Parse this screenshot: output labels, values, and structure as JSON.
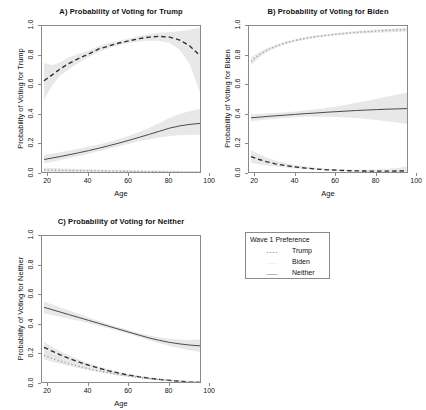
{
  "figure": {
    "axis_x_label": "Age",
    "x_ticks": [
      "20",
      "40",
      "60",
      "80",
      "100"
    ],
    "y_ticks": [
      "0.0",
      "0.2",
      "0.4",
      "0.6",
      "0.8",
      "1.0"
    ]
  },
  "panelA": {
    "title": "A) Probability of Voting for Trump",
    "ylabel": "Probability of Voting for Trump",
    "xlabel": "Age"
  },
  "panelB": {
    "title": "B) Probability of Voting for Biden",
    "ylabel": "Probability of Voting for Biden",
    "xlabel": "Age"
  },
  "panelC": {
    "title": "C) Probability of Voting for Neither",
    "ylabel": "Probability of Voting for Neither",
    "xlabel": "Age"
  },
  "legend": {
    "title": "Wave 1 Preference",
    "items": [
      {
        "label": "Trump",
        "style": "dashed"
      },
      {
        "label": "Biden",
        "style": "dotted"
      },
      {
        "label": "Neither",
        "style": "solid"
      }
    ]
  },
  "chart_data": [
    {
      "type": "line",
      "title": "A) Probability of Voting for Trump",
      "xlabel": "Age",
      "ylabel": "Probability of Voting for Trump",
      "xlim": [
        17,
        96
      ],
      "ylim": [
        0.0,
        1.0
      ],
      "xticks": [
        20,
        40,
        60,
        80,
        100
      ],
      "yticks": [
        0.0,
        0.2,
        0.4,
        0.6,
        0.8,
        1.0
      ],
      "grid": false,
      "legend_position": "external-right-bottom",
      "x": [
        18,
        22,
        26,
        30,
        35,
        40,
        45,
        50,
        55,
        60,
        65,
        70,
        75,
        80,
        85,
        90,
        95
      ],
      "series": [
        {
          "name": "Trump",
          "style": "dashed",
          "values": [
            0.63,
            0.67,
            0.71,
            0.745,
            0.78,
            0.81,
            0.845,
            0.865,
            0.885,
            0.9,
            0.915,
            0.925,
            0.93,
            0.925,
            0.905,
            0.865,
            0.8
          ],
          "ci_low": [
            0.5,
            0.6,
            0.665,
            0.705,
            0.75,
            0.79,
            0.825,
            0.85,
            0.87,
            0.885,
            0.895,
            0.9,
            0.9,
            0.885,
            0.84,
            0.74,
            0.55
          ],
          "ci_high": [
            0.75,
            0.735,
            0.755,
            0.785,
            0.81,
            0.835,
            0.865,
            0.885,
            0.9,
            0.915,
            0.93,
            0.945,
            0.955,
            0.96,
            0.965,
            0.975,
            0.99
          ]
        },
        {
          "name": "Biden",
          "style": "dotted",
          "values": [
            0.027,
            0.026,
            0.025,
            0.024,
            0.023,
            0.022,
            0.021,
            0.02,
            0.019,
            0.018,
            0.017,
            0.016,
            0.015,
            0.014,
            0.013,
            0.012,
            0.011
          ],
          "ci_low": [
            0.014,
            0.014,
            0.014,
            0.013,
            0.013,
            0.012,
            0.012,
            0.011,
            0.01,
            0.009,
            0.008,
            0.007,
            0.006,
            0.005,
            0.004,
            0.003,
            0.002
          ],
          "ci_high": [
            0.042,
            0.04,
            0.038,
            0.036,
            0.034,
            0.032,
            0.03,
            0.029,
            0.028,
            0.027,
            0.026,
            0.025,
            0.024,
            0.023,
            0.022,
            0.021,
            0.02
          ]
        },
        {
          "name": "Neither",
          "style": "solid",
          "values": [
            0.098,
            0.108,
            0.118,
            0.129,
            0.143,
            0.158,
            0.174,
            0.191,
            0.209,
            0.228,
            0.248,
            0.268,
            0.289,
            0.31,
            0.325,
            0.335,
            0.342
          ],
          "ci_low": [
            0.072,
            0.083,
            0.094,
            0.106,
            0.121,
            0.137,
            0.154,
            0.171,
            0.188,
            0.205,
            0.221,
            0.235,
            0.247,
            0.256,
            0.262,
            0.265,
            0.266
          ],
          "ci_high": [
            0.128,
            0.137,
            0.147,
            0.157,
            0.171,
            0.185,
            0.2,
            0.216,
            0.236,
            0.258,
            0.284,
            0.312,
            0.344,
            0.378,
            0.405,
            0.425,
            0.44
          ]
        }
      ]
    },
    {
      "type": "line",
      "title": "B) Probability of Voting for Biden",
      "xlabel": "Age",
      "ylabel": "Probability of Voting for Biden",
      "xlim": [
        17,
        96
      ],
      "ylim": [
        0.0,
        1.0
      ],
      "xticks": [
        20,
        40,
        60,
        80,
        100
      ],
      "yticks": [
        0.0,
        0.2,
        0.4,
        0.6,
        0.8,
        1.0
      ],
      "grid": false,
      "legend_position": "external-right-bottom",
      "x": [
        18,
        22,
        26,
        30,
        35,
        40,
        45,
        50,
        55,
        60,
        65,
        70,
        75,
        80,
        85,
        90,
        95
      ],
      "series": [
        {
          "name": "Trump",
          "style": "dashed",
          "values": [
            0.118,
            0.098,
            0.082,
            0.069,
            0.057,
            0.047,
            0.04,
            0.034,
            0.029,
            0.026,
            0.023,
            0.021,
            0.02,
            0.019,
            0.019,
            0.02,
            0.022
          ],
          "ci_low": [
            0.075,
            0.066,
            0.058,
            0.051,
            0.044,
            0.038,
            0.033,
            0.029,
            0.025,
            0.022,
            0.019,
            0.016,
            0.014,
            0.012,
            0.01,
            0.008,
            0.006
          ],
          "ci_high": [
            0.163,
            0.133,
            0.11,
            0.092,
            0.074,
            0.06,
            0.05,
            0.042,
            0.036,
            0.032,
            0.029,
            0.028,
            0.028,
            0.03,
            0.034,
            0.041,
            0.052
          ]
        },
        {
          "name": "Biden",
          "style": "dotted",
          "values": [
            0.762,
            0.805,
            0.838,
            0.862,
            0.886,
            0.903,
            0.917,
            0.928,
            0.937,
            0.945,
            0.951,
            0.957,
            0.962,
            0.966,
            0.97,
            0.973,
            0.976
          ],
          "ci_low": [
            0.735,
            0.787,
            0.824,
            0.851,
            0.877,
            0.895,
            0.909,
            0.92,
            0.929,
            0.936,
            0.942,
            0.947,
            0.951,
            0.954,
            0.957,
            0.959,
            0.961
          ],
          "ci_high": [
            0.789,
            0.822,
            0.851,
            0.873,
            0.894,
            0.911,
            0.925,
            0.936,
            0.945,
            0.953,
            0.96,
            0.966,
            0.971,
            0.976,
            0.98,
            0.984,
            0.988
          ]
        },
        {
          "name": "Neither",
          "style": "solid",
          "values": [
            0.38,
            0.384,
            0.389,
            0.393,
            0.398,
            0.403,
            0.408,
            0.412,
            0.417,
            0.421,
            0.425,
            0.429,
            0.432,
            0.435,
            0.438,
            0.44,
            0.442
          ],
          "ci_low": [
            0.357,
            0.363,
            0.369,
            0.374,
            0.379,
            0.383,
            0.386,
            0.387,
            0.387,
            0.385,
            0.382,
            0.378,
            0.372,
            0.365,
            0.357,
            0.348,
            0.338
          ],
          "ci_high": [
            0.403,
            0.406,
            0.41,
            0.413,
            0.418,
            0.423,
            0.43,
            0.437,
            0.446,
            0.456,
            0.468,
            0.481,
            0.494,
            0.508,
            0.522,
            0.536,
            0.55
          ]
        }
      ]
    },
    {
      "type": "line",
      "title": "C) Probability of Voting for Neither",
      "xlabel": "Age",
      "ylabel": "Probability of Voting for Neither",
      "xlim": [
        17,
        96
      ],
      "ylim": [
        0.0,
        1.0
      ],
      "xticks": [
        20,
        40,
        60,
        80,
        100
      ],
      "yticks": [
        0.0,
        0.2,
        0.4,
        0.6,
        0.8,
        1.0
      ],
      "grid": false,
      "legend_position": "external-right-bottom",
      "x": [
        18,
        22,
        26,
        30,
        35,
        40,
        45,
        50,
        55,
        60,
        65,
        70,
        75,
        80,
        85,
        90,
        95
      ],
      "series": [
        {
          "name": "Trump",
          "style": "dashed",
          "values": [
            0.248,
            0.222,
            0.197,
            0.175,
            0.149,
            0.127,
            0.107,
            0.089,
            0.073,
            0.06,
            0.048,
            0.039,
            0.031,
            0.024,
            0.019,
            0.014,
            0.011
          ],
          "ci_low": [
            0.212,
            0.192,
            0.173,
            0.155,
            0.134,
            0.115,
            0.097,
            0.081,
            0.066,
            0.053,
            0.042,
            0.033,
            0.025,
            0.019,
            0.014,
            0.01,
            0.007
          ],
          "ci_high": [
            0.284,
            0.252,
            0.222,
            0.196,
            0.165,
            0.14,
            0.118,
            0.099,
            0.082,
            0.068,
            0.056,
            0.046,
            0.038,
            0.031,
            0.025,
            0.02,
            0.017
          ]
        },
        {
          "name": "Biden",
          "style": "dotted",
          "values": [
            0.193,
            0.173,
            0.155,
            0.139,
            0.12,
            0.103,
            0.088,
            0.075,
            0.063,
            0.053,
            0.044,
            0.036,
            0.029,
            0.024,
            0.019,
            0.015,
            0.012
          ],
          "ci_low": [
            0.166,
            0.151,
            0.137,
            0.124,
            0.108,
            0.094,
            0.081,
            0.069,
            0.058,
            0.048,
            0.04,
            0.032,
            0.026,
            0.02,
            0.016,
            0.012,
            0.009
          ],
          "ci_high": [
            0.22,
            0.196,
            0.174,
            0.155,
            0.133,
            0.113,
            0.096,
            0.082,
            0.069,
            0.059,
            0.049,
            0.041,
            0.034,
            0.028,
            0.023,
            0.019,
            0.015
          ]
        },
        {
          "name": "Neither",
          "style": "solid",
          "values": [
            0.518,
            0.502,
            0.486,
            0.47,
            0.45,
            0.43,
            0.41,
            0.39,
            0.37,
            0.35,
            0.33,
            0.311,
            0.295,
            0.281,
            0.271,
            0.263,
            0.258
          ],
          "ci_low": [
            0.478,
            0.466,
            0.455,
            0.443,
            0.427,
            0.411,
            0.394,
            0.376,
            0.357,
            0.337,
            0.316,
            0.295,
            0.275,
            0.257,
            0.241,
            0.228,
            0.216
          ],
          "ci_high": [
            0.558,
            0.538,
            0.518,
            0.498,
            0.474,
            0.45,
            0.427,
            0.404,
            0.383,
            0.363,
            0.345,
            0.328,
            0.315,
            0.305,
            0.3,
            0.298,
            0.3
          ]
        }
      ]
    }
  ]
}
